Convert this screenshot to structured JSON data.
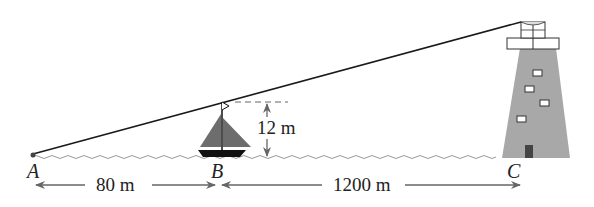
{
  "diagram": {
    "type": "lighthouse-similar-triangles",
    "points": {
      "A": "A",
      "B": "B",
      "C": "C"
    },
    "measurements": {
      "mast_height": "12 m",
      "AB": "80 m",
      "BC": "1200 m"
    },
    "colors": {
      "line": "#1a1a1a",
      "arrow": "#666666",
      "sail": "#6d6d6d",
      "tower": "#a8a8a8",
      "water": "#999999",
      "door": "#444444"
    }
  }
}
